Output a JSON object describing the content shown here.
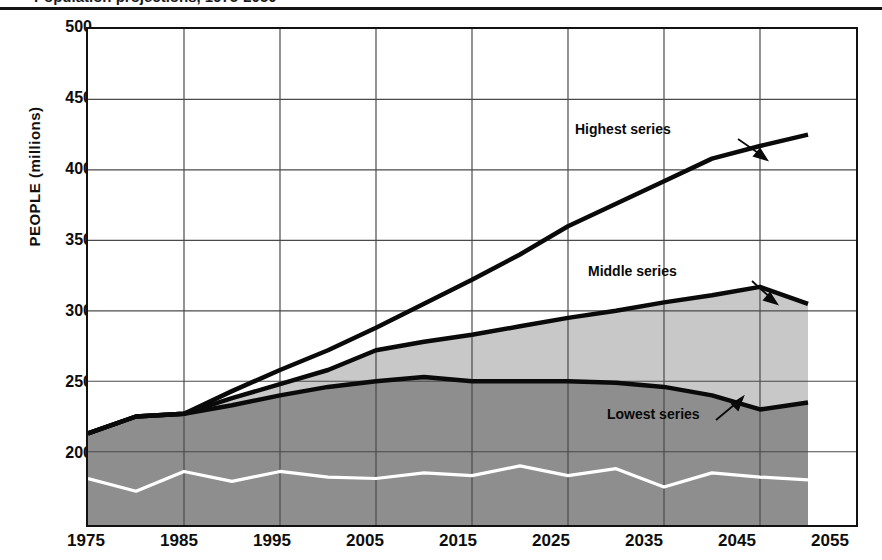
{
  "figure": {
    "title": "Population projections, 1975-2050",
    "ylabel": "PEOPLE (millions)"
  },
  "annotations": {
    "highest": "Highest series",
    "middle": "Middle series",
    "lowest": "Lowest series"
  },
  "ticks": {
    "y": [
      "500",
      "450",
      "400",
      "350",
      "300",
      "250",
      "200"
    ],
    "x": [
      "1975",
      "1985",
      "1995",
      "2005",
      "2015",
      "2025",
      "2035",
      "2045",
      "2055"
    ]
  },
  "colors": {
    "axis": "#111111",
    "grid": "#555555",
    "line": "#0a0a0a",
    "band_highest": "#ffffff",
    "band_middle": "#c8c8c8",
    "band_lowest": "#8e8e8e",
    "oscillator": "#ffffff"
  },
  "chart_data": {
    "type": "line",
    "title": "Population projections, 1975-2050",
    "xlabel": "",
    "ylabel": "PEOPLE (millions)",
    "xlim": [
      1975,
      2055
    ],
    "ylim": [
      148,
      500
    ],
    "grid": true,
    "legend": "inline-annotations",
    "x": [
      1975,
      1980,
      1985,
      1990,
      1995,
      2000,
      2005,
      2010,
      2015,
      2020,
      2025,
      2030,
      2035,
      2040,
      2045,
      2050
    ],
    "series": [
      {
        "name": "Highest series",
        "label_position": {
          "x": 2023,
          "y": 412
        },
        "values": [
          213,
          225,
          227,
          243,
          258,
          272,
          288,
          305,
          322,
          340,
          360,
          376,
          392,
          408,
          417,
          425
        ]
      },
      {
        "name": "Middle series",
        "label_position": {
          "x": 2031,
          "y": 327
        },
        "values": [
          213,
          225,
          227,
          238,
          248,
          258,
          272,
          278,
          283,
          289,
          295,
          300,
          306,
          311,
          317,
          305
        ]
      },
      {
        "name": "Lowest series",
        "label_position": {
          "x": 2021,
          "y": 222
        },
        "values": [
          213,
          225,
          227,
          233,
          240,
          246,
          250,
          253,
          250,
          250,
          250,
          249,
          246,
          240,
          230,
          235
        ]
      },
      {
        "name": "oscillating-baseline",
        "values": [
          181,
          172,
          186,
          179,
          186,
          182,
          181,
          185,
          183,
          190,
          183,
          188,
          175,
          185,
          182,
          180
        ]
      }
    ]
  }
}
